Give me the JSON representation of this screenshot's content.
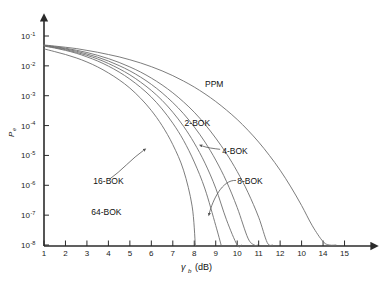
{
  "chart_data": {
    "type": "line",
    "title": "",
    "subtitle": "",
    "xlabel": "γb  (dB)",
    "xlabel_symbol": "γ",
    "xlabel_sub": "b",
    "xlabel_unit": "(dB)",
    "ylabel": "Pe",
    "ylabel_symbol": "P",
    "ylabel_sub": "e",
    "xlim": [
      1,
      16
    ],
    "ylim": [
      1e-08,
      0.1
    ],
    "yscale": "log",
    "grid": false,
    "legend_position": "inline-annotations",
    "xticks": [
      1,
      2,
      3,
      4,
      5,
      6,
      7,
      8,
      9,
      10,
      11,
      12,
      13,
      14,
      15
    ],
    "xtick_labels": [
      "1",
      "2",
      "3",
      "4",
      "5",
      "6",
      "7",
      "8",
      "9",
      "10",
      "11",
      "12",
      "10",
      "14",
      "15"
    ],
    "yticks": [
      0.1,
      0.01,
      0.001,
      0.0001,
      1e-05,
      1e-06,
      1e-07,
      1e-08
    ],
    "ytick_labels": [
      {
        "mantissa": "10",
        "exponent": "-1"
      },
      {
        "mantissa": "10",
        "exponent": "-2"
      },
      {
        "mantissa": "10",
        "exponent": "-3"
      },
      {
        "mantissa": "10",
        "exponent": "-4"
      },
      {
        "mantissa": "10",
        "exponent": "-5"
      },
      {
        "mantissa": "10",
        "exponent": "-6"
      },
      {
        "mantissa": "10",
        "exponent": "-7"
      },
      {
        "mantissa": "10",
        "exponent": "-8"
      }
    ],
    "series": [
      {
        "name": "PPM",
        "label": "PPM",
        "color": "#6e6e6e",
        "x": [
          1.0,
          1.5,
          2.0,
          2.5,
          3.0,
          3.5,
          4.0,
          4.5,
          5.0,
          5.5,
          6.0,
          6.5,
          7.0,
          7.5,
          8.0,
          8.5,
          9.0,
          9.5,
          10.0,
          10.5,
          11.0,
          11.5,
          12.0,
          12.5,
          13.0,
          13.5,
          14.0,
          14.3,
          14.6
        ],
        "y": [
          0.05,
          0.046,
          0.042,
          0.038,
          0.033,
          0.0285,
          0.024,
          0.02,
          0.016,
          0.0125,
          0.0094,
          0.0068,
          0.0047,
          0.0031,
          0.00195,
          0.00115,
          0.00064,
          0.00033,
          0.00016,
          7e-05,
          2.8e-05,
          1e-05,
          3.2e-06,
          8.8e-07,
          2.1e-07,
          4.4e-08,
          1.3e-08,
          1e-08,
          1e-08
        ]
      },
      {
        "name": "2-BOK",
        "label": "2-BOK",
        "color": "#6e6e6e",
        "x": [
          1.0,
          1.5,
          2.0,
          2.5,
          3.0,
          3.5,
          4.0,
          4.5,
          5.0,
          5.5,
          6.0,
          6.5,
          7.0,
          7.5,
          8.0,
          8.5,
          9.0,
          9.5,
          10.0,
          10.5,
          11.0,
          11.4,
          11.65
        ],
        "y": [
          0.049,
          0.044,
          0.039,
          0.0335,
          0.028,
          0.0225,
          0.0175,
          0.013,
          0.0092,
          0.0062,
          0.0039,
          0.0023,
          0.00125,
          0.00062,
          0.00028,
          0.00011,
          3.8e-05,
          1.15e-05,
          2.9e-06,
          5.8e-07,
          8.5e-08,
          1.2e-08,
          1e-08
        ]
      },
      {
        "name": "4-BOK",
        "label": "4-BOK",
        "color": "#6e6e6e",
        "x": [
          1.0,
          1.5,
          2.0,
          2.5,
          3.0,
          3.5,
          4.0,
          4.5,
          5.0,
          5.5,
          6.0,
          6.5,
          7.0,
          7.5,
          8.0,
          8.5,
          9.0,
          9.5,
          10.0,
          10.5,
          10.8,
          10.95
        ],
        "y": [
          0.048,
          0.0425,
          0.037,
          0.031,
          0.025,
          0.0195,
          0.0145,
          0.0102,
          0.0068,
          0.0042,
          0.0024,
          0.00125,
          0.00059,
          0.00025,
          9e-05,
          2.8e-05,
          7e-06,
          1.35e-06,
          1.8e-07,
          1.7e-08,
          1e-08,
          1e-08
        ]
      },
      {
        "name": "8-BOK",
        "label": "8-BOK",
        "color": "#6e6e6e",
        "x": [
          1.0,
          1.5,
          2.0,
          2.5,
          3.0,
          3.5,
          4.0,
          4.5,
          5.0,
          5.5,
          6.0,
          6.5,
          7.0,
          7.5,
          8.0,
          8.5,
          9.0,
          9.5,
          10.0,
          10.2
        ],
        "y": [
          0.047,
          0.041,
          0.035,
          0.0285,
          0.0225,
          0.017,
          0.012,
          0.008,
          0.005,
          0.00285,
          0.0015,
          0.0007,
          0.00028,
          9.5e-05,
          2.6e-05,
          5.5e-06,
          8e-07,
          7e-08,
          1e-08,
          1e-08
        ]
      },
      {
        "name": "16-BOK",
        "label": "16-BOK",
        "color": "#6e6e6e",
        "x": [
          1.0,
          1.5,
          2.0,
          2.5,
          3.0,
          3.5,
          4.0,
          4.5,
          5.0,
          5.5,
          6.0,
          6.5,
          7.0,
          7.5,
          8.0,
          8.5,
          9.0,
          9.25
        ],
        "y": [
          0.046,
          0.0395,
          0.033,
          0.0265,
          0.02,
          0.0145,
          0.0098,
          0.0062,
          0.0036,
          0.0019,
          0.0009,
          0.00036,
          0.00012,
          3.2e-05,
          6e-06,
          7.5e-07,
          4.5e-08,
          1e-08
        ]
      },
      {
        "name": "64-BOK",
        "label": "64-BOK",
        "color": "#6e6e6e",
        "x": [
          1.0,
          1.5,
          2.0,
          2.5,
          3.0,
          3.5,
          4.0,
          4.5,
          5.0,
          5.5,
          6.0,
          6.5,
          7.0,
          7.5,
          7.9,
          8.05
        ],
        "y": [
          0.037,
          0.03,
          0.024,
          0.0185,
          0.0135,
          0.0092,
          0.0058,
          0.0034,
          0.0018,
          0.00082,
          0.00032,
          0.0001,
          2.3e-05,
          3.2e-06,
          2e-07,
          1e-08
        ]
      }
    ],
    "annotations": [
      {
        "text": "PPM",
        "x": 8.5,
        "y": 0.002,
        "has_leader": false
      },
      {
        "text": "2-BOK",
        "x": 7.55,
        "y": 0.0001,
        "has_leader": false
      },
      {
        "text": "4-BOK",
        "x": 9.3,
        "y": 1.15e-05,
        "has_leader": true
      },
      {
        "text": "8-BOK",
        "x": 10.0,
        "y": 1.1e-06,
        "has_leader": true
      },
      {
        "text": "16-BOK",
        "x": 3.3,
        "y": 1.1e-06,
        "has_leader": true
      },
      {
        "text": "64-BOK",
        "x": 3.2,
        "y": 1e-07,
        "has_leader": false
      }
    ]
  },
  "figure": {
    "background_color": "#ffffff",
    "axis_color": "#2b2b2b",
    "curve_color": "#6e6e6e",
    "text_color": "#111111"
  }
}
